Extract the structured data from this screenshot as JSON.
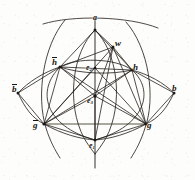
{
  "figure": {
    "type": "geometric-diagram",
    "background_color": "#fdfdfb",
    "ink_color": "#1a1713",
    "width": 195,
    "height": 180
  },
  "labels": [
    {
      "id": "p-top",
      "text": "a",
      "overline": false,
      "sub": "",
      "x": 93,
      "y": 14,
      "size": "sz-md"
    },
    {
      "id": "p-w",
      "text": "w",
      "overline": false,
      "sub": "",
      "x": 115,
      "y": 39,
      "size": "sz-lg"
    },
    {
      "id": "p-hbar",
      "text": "h",
      "overline": true,
      "sub": "",
      "x": 52,
      "y": 57,
      "size": "sz-lg"
    },
    {
      "id": "p-h",
      "text": "h",
      "overline": false,
      "sub": "",
      "x": 133,
      "y": 63,
      "size": "sz-lg"
    },
    {
      "id": "p-e2",
      "text": "e",
      "overline": false,
      "sub": "2",
      "x": 86,
      "y": 64,
      "size": "sz-md"
    },
    {
      "id": "p-bbar",
      "text": "b",
      "overline": true,
      "sub": "",
      "x": 12,
      "y": 84,
      "size": "sz-lg"
    },
    {
      "id": "p-b",
      "text": "b",
      "overline": false,
      "sub": "",
      "x": 172,
      "y": 84,
      "size": "sz-lg"
    },
    {
      "id": "p-e3",
      "text": "e",
      "overline": false,
      "sub": "3",
      "x": 87,
      "y": 97,
      "size": "sz-md"
    },
    {
      "id": "p-gbar",
      "text": "g",
      "overline": true,
      "sub": "",
      "x": 33,
      "y": 120,
      "size": "sz-lg"
    },
    {
      "id": "p-g",
      "text": "g",
      "overline": false,
      "sub": "",
      "x": 147,
      "y": 121,
      "size": "sz-lg"
    },
    {
      "id": "p-e1",
      "text": "e",
      "overline": false,
      "sub": "1",
      "x": 89,
      "y": 142,
      "size": "sz-md"
    }
  ],
  "vertices": [
    {
      "id": "v-a",
      "label": "a",
      "x": 95,
      "y": 30
    },
    {
      "id": "v-w",
      "label": "w",
      "x": 113,
      "y": 47
    },
    {
      "id": "v-hbar",
      "label": "h̄",
      "x": 60,
      "y": 67
    },
    {
      "id": "v-h",
      "label": "h",
      "x": 132,
      "y": 70
    },
    {
      "id": "v-e2",
      "label": "e2",
      "x": 95,
      "y": 68
    },
    {
      "id": "v-bbar",
      "label": "b̄",
      "x": 18,
      "y": 93
    },
    {
      "id": "v-b",
      "label": "b",
      "x": 174,
      "y": 93
    },
    {
      "id": "v-e3",
      "label": "e3",
      "x": 95,
      "y": 96
    },
    {
      "id": "v-gbar",
      "label": "ḡ",
      "x": 44,
      "y": 124
    },
    {
      "id": "v-g",
      "label": "g",
      "x": 146,
      "y": 124
    },
    {
      "id": "v-e1",
      "label": "e1",
      "x": 95,
      "y": 140
    }
  ],
  "elements": {
    "axis_vertical": "vertical line through a, e2, e3, e1",
    "great_circle_outer": "large circle through h̄, e3, h",
    "arc_top": "upper arc through h̄, a, h region",
    "arc_left": "arc through b̄, g ̄, e1",
    "arc_right": "arc through b, g, e1",
    "chords": "straight chords connecting labelled poles"
  }
}
